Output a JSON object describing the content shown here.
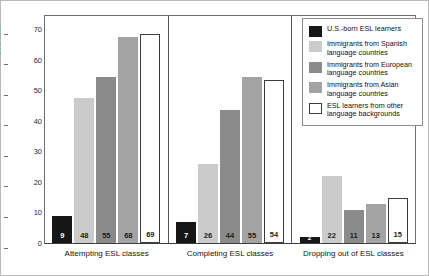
{
  "chart_data": {
    "type": "bar",
    "title": "",
    "xlabel": "",
    "ylabel": "Percent",
    "ylim": [
      0,
      75
    ],
    "yticks": [
      0,
      10,
      20,
      30,
      40,
      50,
      60,
      70
    ],
    "grid": false,
    "legend_position": "top-right",
    "categories": [
      "Attempting ESL classes",
      "Completing ESL classes",
      "Dropping out of ESL classes"
    ],
    "series": [
      {
        "name": "U.S.-born ESL learners",
        "color": "#171717",
        "label_color": "#ffffff",
        "values": [
          9,
          7,
          2
        ]
      },
      {
        "name": "Immigrants from Spanish language countries",
        "color": "#cbcbcb",
        "label_color": "#1b1b1b",
        "values": [
          48,
          26,
          22
        ]
      },
      {
        "name": "Immigrants from European language countries",
        "color": "#8b8b8b",
        "label_color": "#1b1b1b",
        "values": [
          55,
          44,
          11
        ]
      },
      {
        "name": "Immigrants from Asian language countries",
        "color": "#a3a3a3",
        "label_color": "#1b1b1b",
        "values": [
          68,
          55,
          13
        ]
      },
      {
        "name": "ESL learners from other language backgrounds",
        "color": "#ffffff",
        "border": "#3d3d3d",
        "label_color": "#1b1b1b",
        "values": [
          69,
          54,
          15
        ]
      }
    ]
  },
  "legend": {
    "items": [
      {
        "label_line1": "U.S.-born ESL learners",
        "label_line2": ""
      },
      {
        "label_line1": "Immigrants from Spanish",
        "label_line2": "language countries"
      },
      {
        "label_line1": "Immigrants from European",
        "label_line2": "language countries"
      },
      {
        "label_line1": "Immigrants from Asian",
        "label_line2": "language countries"
      },
      {
        "label_line1": "ESL learners from other",
        "label_line2": "language backgrounds"
      }
    ]
  }
}
